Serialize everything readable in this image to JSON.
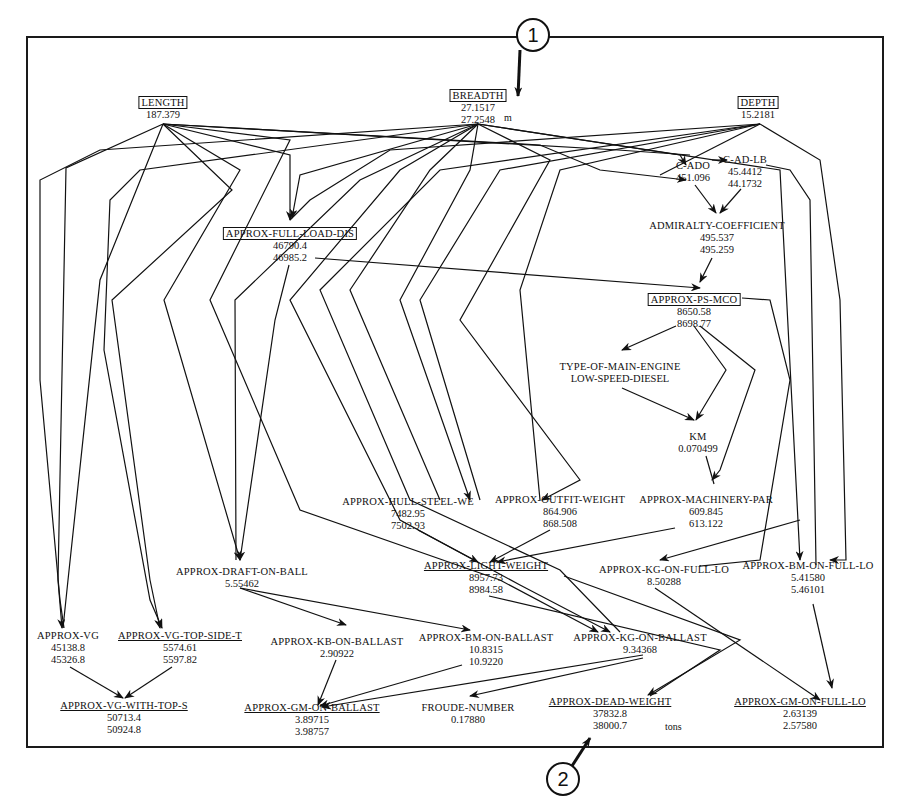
{
  "diagram": {
    "nodes": {
      "length": {
        "label": "LENGTH",
        "values": [
          "187.379"
        ],
        "style": "boxed"
      },
      "breadth": {
        "label": "BREADTH",
        "values": [
          "27.1517",
          "27.2548"
        ],
        "unit": "m",
        "style": "boxed"
      },
      "depth": {
        "label": "DEPTH",
        "values": [
          "15.2181"
        ],
        "style": "boxed"
      },
      "c_ado": {
        "label": "C-ADO",
        "values": [
          "451.096"
        ]
      },
      "c_ad_lb": {
        "label": "C-AD-LB",
        "values": [
          "45.4412",
          "44.1732"
        ]
      },
      "admiralty_coefficient": {
        "label": "ADMIRALTY-COEFFICIENT",
        "values": [
          "495.537",
          "495.259"
        ]
      },
      "approx_full_load_dis": {
        "label": "APPROX-FULL-LOAD-DIS",
        "values": [
          "46790.4",
          "46985.2"
        ],
        "style": "boxed"
      },
      "approx_ps_mco": {
        "label": "APPROX-PS-MCO",
        "values": [
          "8650.58",
          "8698.77"
        ],
        "style": "boxed"
      },
      "type_of_main_engine": {
        "label": "TYPE-OF-MAIN-ENGINE",
        "values": [
          "LOW-SPEED-DIESEL"
        ]
      },
      "km": {
        "label": "KM",
        "values": [
          "0.070499"
        ]
      },
      "approx_hull_steel_we": {
        "label": "APPROX-HULL-STEEL-WE",
        "values": [
          "7482.95",
          "7502.93"
        ]
      },
      "approx_outfit_weight": {
        "label": "APPROX-OUTFIT-WEIGHT",
        "values": [
          "864.906",
          "868.508"
        ]
      },
      "approx_machinery_par": {
        "label": "APPROX-MACHINERY-PAR",
        "values": [
          "609.845",
          "613.122"
        ]
      },
      "approx_light_weight": {
        "label": "APPROX-LIGHT-WEIGHT",
        "values": [
          "8957.73",
          "8984.58"
        ],
        "style": "underline"
      },
      "approx_kg_on_full_lo": {
        "label": "APPROX-KG-ON-FULL-LO",
        "values": [
          "8.50288"
        ]
      },
      "approx_bm_on_full_lo": {
        "label": "APPROX-BM-ON-FULL-LO",
        "values": [
          "5.41580",
          "5.46101"
        ]
      },
      "approx_draft_on_ball": {
        "label": "APPROX-DRAFT-ON-BALL",
        "values": [
          "5.55462"
        ]
      },
      "approx_vg": {
        "label": "APPROX-VG",
        "values": [
          "45138.8",
          "45326.8"
        ]
      },
      "approx_vg_top_side_t": {
        "label": "APPROX-VG-TOP-SIDE-T",
        "values": [
          "5574.61",
          "5597.82"
        ],
        "style": "underline"
      },
      "approx_kb_on_ballast": {
        "label": "APPROX-KB-ON-BALLAST",
        "values": [
          "2.90922"
        ]
      },
      "approx_bm_on_ballast": {
        "label": "APPROX-BM-ON-BALLAST",
        "values": [
          "10.8315",
          "10.9220"
        ]
      },
      "approx_kg_on_ballast": {
        "label": "APPROX-KG-ON-BALLAST",
        "values": [
          "9.34368"
        ]
      },
      "approx_vg_with_top_s": {
        "label": "APPROX-VG-WITH-TOP-S",
        "values": [
          "50713.4",
          "50924.8"
        ],
        "style": "underline"
      },
      "approx_gm_on_ballast": {
        "label": "APPROX-GM-ON-BALLAST",
        "values": [
          "3.89715",
          "3.98757"
        ],
        "style": "underline"
      },
      "froude_number": {
        "label": "FROUDE-NUMBER",
        "values": [
          "0.17880"
        ]
      },
      "approx_dead_weight": {
        "label": "APPROX-DEAD-WEIGHT",
        "values": [
          "37832.8",
          "38000.7"
        ],
        "unit": "tons",
        "style": "underline"
      },
      "approx_gm_on_full_lo": {
        "label": "APPROX-GM-ON-FULL-LO",
        "values": [
          "2.63139",
          "2.57580"
        ],
        "style": "underline"
      }
    },
    "callouts": [
      {
        "number": "1",
        "target": "breadth"
      },
      {
        "number": "2",
        "target": "approx_dead_weight"
      }
    ]
  }
}
